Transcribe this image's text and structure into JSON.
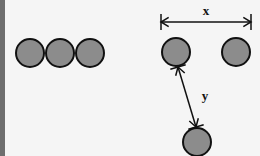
{
  "diagram": {
    "colors": {
      "circle_fill": "#8c8c8c",
      "stroke": "#111111",
      "background": "#f5f5f5",
      "left_edge": "#6e6e6e"
    },
    "left_group": {
      "description": "three touching circles",
      "circles": [
        {
          "cx": 30,
          "cy": 53,
          "r": 14
        },
        {
          "cx": 60,
          "cy": 53,
          "r": 14
        },
        {
          "cx": 90,
          "cy": 53,
          "r": 14
        }
      ]
    },
    "right_group": {
      "circles": [
        {
          "cx": 176,
          "cy": 52,
          "r": 14
        },
        {
          "cx": 236,
          "cy": 52,
          "r": 14
        },
        {
          "cx": 197,
          "cy": 142,
          "r": 14
        }
      ],
      "x_dimension": {
        "label": "x",
        "x1": 161,
        "x2": 251,
        "y": 22,
        "label_x": 206,
        "label_y": 15
      },
      "y_dimension": {
        "label": "y",
        "x1": 178,
        "y1": 67,
        "x2": 196,
        "y2": 127,
        "label_x": 205,
        "label_y": 100
      }
    }
  }
}
